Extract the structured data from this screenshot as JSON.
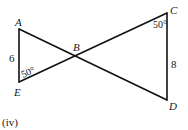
{
  "figure": {
    "caption": "(iv)",
    "points": {
      "A": "A",
      "B": "B",
      "C": "C",
      "D": "D",
      "E": "E"
    },
    "segments": [
      {
        "from": "A",
        "to": "E",
        "length_label": "6"
      },
      {
        "from": "C",
        "to": "D",
        "length_label": "8"
      },
      {
        "from": "A",
        "to": "D",
        "length_label": ""
      },
      {
        "from": "E",
        "to": "C",
        "length_label": ""
      }
    ],
    "angles": {
      "at_E": "50°",
      "at_C": "50°"
    },
    "intersection": "B"
  }
}
